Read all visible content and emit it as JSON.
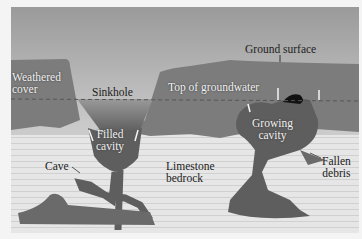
{
  "diagram": {
    "labels": {
      "weathered_cover": "Weathered cover",
      "sinkhole": "Sinkhole",
      "top_of_groundwater": "Top of groundwater",
      "ground_surface": "Ground surface",
      "filled_cavity_1": "Filled",
      "filled_cavity_2": "cavity",
      "growing_cavity_1": "Growing",
      "growing_cavity_2": "cavity",
      "cave": "Cave",
      "limestone_1": "Limestone",
      "limestone_2": "bedrock",
      "fallen_1": "Fallen",
      "fallen_2": "debris",
      "weathered_1": "Weathered",
      "weathered_2": "cover"
    },
    "colors": {
      "sky": "#d8d8d8",
      "weathered_cover": "#7a7a7a",
      "bedrock": "#e4e4e4",
      "cavity": "#5e5e5e",
      "water": "#8a8a8a",
      "dashed_line": "#555555"
    }
  }
}
